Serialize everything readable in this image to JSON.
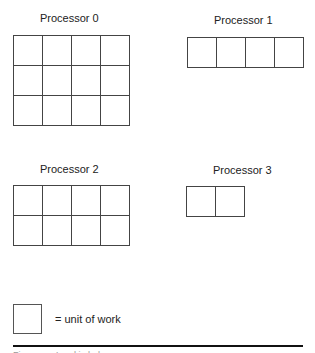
{
  "diagram": {
    "processors": [
      {
        "label": "Processor 0",
        "rows": 3,
        "cols": 4
      },
      {
        "label": "Processor 1",
        "rows": 1,
        "cols": 4
      },
      {
        "label": "Processor 2",
        "rows": 2,
        "cols": 4
      },
      {
        "label": "Processor 3",
        "rows": 1,
        "cols": 2
      }
    ],
    "legend": {
      "text": "= unit of work"
    },
    "caption": "Figure . . . Load imbalance"
  }
}
